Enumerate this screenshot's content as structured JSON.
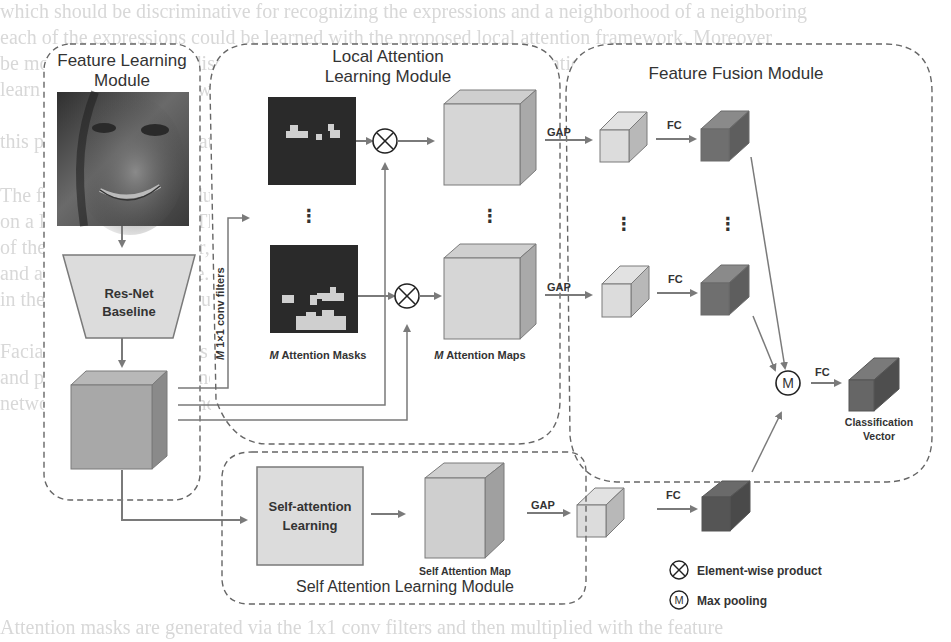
{
  "background_text": [
    "which should be discriminative for recognizing the expressions and a neighborhood of a neighboring",
    "each of the expressions could be learned with the proposed local attention framework. Moreover",
    "be more focused on the discriminative regions. Besides, a global attention branch is proposed to",
    "learn with a different view for this facial expression in given samples",
    "",
    "this part of data augmentation is given in the following section",
    "",
    "The feature learning module is based on the classical ResNet architecture pretrained",
    "on a large-scale dataset. The attention module shares weights across multiple branches",
    "of the network. Moreover, the local attention masks are learned from intermediate feature maps",
    "and applied element-wise. Multiple local attention maps and one self attention map are fused",
    "in the feature fusion module to produce a final classification vector.",
    "",
    "Facial expression features from different attention maps are aggregated using max pooling",
    "and passed to a fully connected layer to obtain the final prediction. The whole",
    "network can be trained end to end, and the experimental performance is reported",
    "",
    "",
    "",
    "Attention masks are generated via the 1x1 conv filters and then multiplied with the feature"
  ],
  "modules": {
    "feature_learning": {
      "title_line1": "Feature Learning",
      "title_line2": "Module",
      "backbone_line1": "Res-Net",
      "backbone_line2": "Baseline"
    },
    "local_attention": {
      "title_line1": "Local Attention",
      "title_line2": "Learning Module",
      "conv_label_italic": "M",
      "conv_label": " 1×1 conv filters",
      "masks_label_italic": "M",
      "masks_label": " Attention Masks",
      "maps_label_italic": "M",
      "maps_label": "  Attention Maps",
      "ellipsis": "⋮"
    },
    "feature_fusion": {
      "title": "Feature Fusion Module",
      "gap_label": "GAP",
      "fc_label": "FC",
      "max_symbol": "M",
      "output_line1": "Classification",
      "output_line2": "Vector"
    },
    "self_attention": {
      "title": "Self Attention Learning Module",
      "block_line1": "Self-attention",
      "block_line2": "Learning",
      "map_label": "Self Attention Map"
    }
  },
  "legend": [
    {
      "icon": "element-wise-product-icon",
      "label": "Element-wise product"
    },
    {
      "icon": "max-pooling-icon",
      "symbol": "M",
      "label": "Max pooling"
    }
  ],
  "colors": {
    "light_box": "#d6d6d6",
    "mid_box": "#a9a9a9",
    "dark_box": "#6f6f6f",
    "mask_bg": "#2a2a2a",
    "mask_fg": "#cfcfcf",
    "line": "#7a7a7a",
    "dashed_border": "#666666"
  }
}
